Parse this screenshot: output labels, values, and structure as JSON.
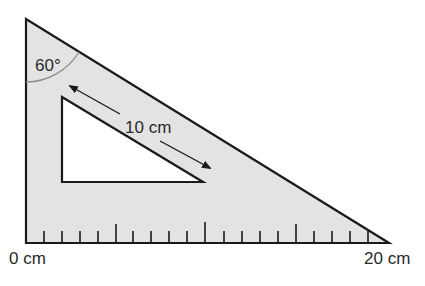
{
  "diagram": {
    "type": "set-square-ruler",
    "colors": {
      "fill": "#e3e3e3",
      "stroke": "#1a1a1a",
      "arc": "#8a8a8a",
      "inner_fill": "#ffffff"
    },
    "angle_label": "60°",
    "inner_length_label": "10 cm",
    "scale": {
      "start_label": "0 cm",
      "end_label": "20 cm",
      "min": 0,
      "max": 20,
      "tick_count": 19
    }
  }
}
